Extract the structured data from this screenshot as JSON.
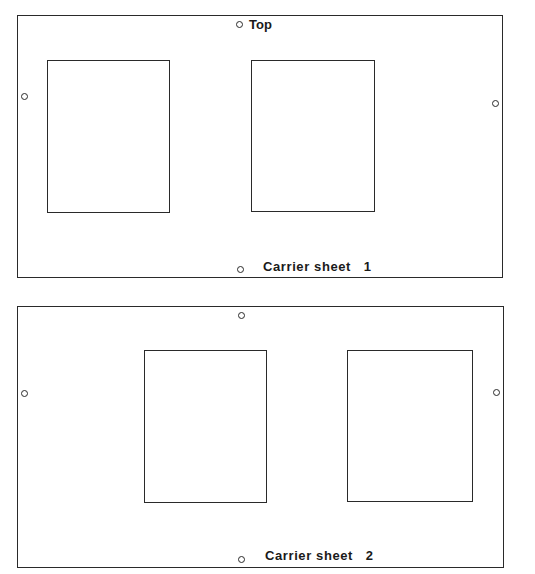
{
  "sheets": [
    {
      "id": 1,
      "label": "Carrier sheet   1",
      "top_label": "Top",
      "windows": 2,
      "holes": 4
    },
    {
      "id": 2,
      "label": "Carrier sheet   2",
      "windows": 2,
      "holes": 4
    }
  ],
  "colors": {
    "line": "#2a2a2a",
    "background": "#ffffff"
  }
}
